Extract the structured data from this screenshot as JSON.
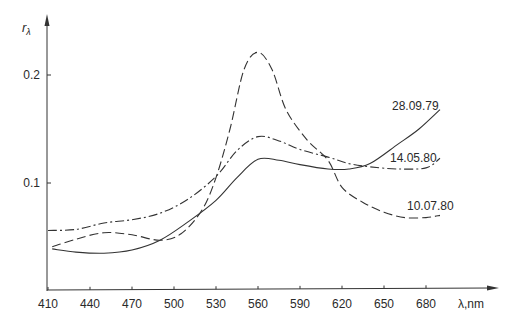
{
  "chart_data": {
    "type": "line",
    "title": "",
    "xlabel": "λ,nm",
    "ylabel": "rλ",
    "xlim": [
      410,
      700
    ],
    "ylim": [
      0,
      0.24
    ],
    "xticks": [
      410,
      440,
      470,
      500,
      530,
      560,
      590,
      620,
      650,
      680
    ],
    "xtick_labels": [
      "410",
      "440",
      "470",
      "500",
      "530",
      "560",
      "590",
      "620",
      "650",
      "680"
    ],
    "yticks": [
      0.1,
      0.2
    ],
    "ytick_labels": [
      "0.1",
      "0.2"
    ],
    "grid": false,
    "legend_position": "inline labels at right end of each curve",
    "series": [
      {
        "name": "28.09.79",
        "style": "solid",
        "x": [
          413,
          430,
          450,
          470,
          490,
          510,
          530,
          545,
          560,
          575,
          590,
          610,
          625,
          640,
          660,
          675,
          690
        ],
        "values": [
          0.039,
          0.036,
          0.035,
          0.038,
          0.047,
          0.064,
          0.084,
          0.105,
          0.122,
          0.121,
          0.117,
          0.113,
          0.113,
          0.118,
          0.136,
          0.15,
          0.168
        ],
        "label_pos": [
          392,
          110
        ]
      },
      {
        "name": "14.05.80",
        "style": "dash-dot",
        "x": [
          410,
          430,
          450,
          470,
          490,
          510,
          530,
          545,
          560,
          575,
          590,
          610,
          625,
          640,
          660,
          680,
          690
        ],
        "values": [
          0.056,
          0.057,
          0.063,
          0.066,
          0.072,
          0.085,
          0.106,
          0.13,
          0.143,
          0.139,
          0.131,
          0.124,
          0.118,
          0.115,
          0.113,
          0.114,
          0.123
        ],
        "label_pos": [
          390,
          162
        ]
      },
      {
        "name": "10.07.80",
        "style": "dashed",
        "x": [
          413,
          430,
          450,
          470,
          490,
          505,
          520,
          530,
          540,
          550,
          560,
          570,
          580,
          595,
          610,
          620,
          635,
          650,
          665,
          680,
          690
        ],
        "values": [
          0.041,
          0.048,
          0.054,
          0.052,
          0.047,
          0.053,
          0.075,
          0.105,
          0.15,
          0.205,
          0.221,
          0.205,
          0.168,
          0.14,
          0.121,
          0.096,
          0.082,
          0.073,
          0.068,
          0.068,
          0.07
        ],
        "label_pos": [
          407,
          210
        ]
      }
    ]
  },
  "axis_labels": {
    "x": "λ,nm",
    "y_main": "r",
    "y_sub": "λ"
  }
}
